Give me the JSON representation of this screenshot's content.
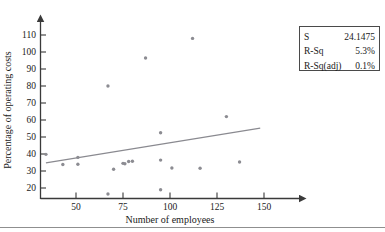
{
  "chart_data": {
    "type": "scatter",
    "title": "",
    "xlabel": "Number of employees",
    "ylabel": "Percentage of operating costs",
    "xlim": [
      30,
      160
    ],
    "ylim": [
      14,
      116
    ],
    "xticks": [
      50,
      75,
      100,
      125,
      150
    ],
    "yticks": [
      20,
      30,
      40,
      50,
      60,
      70,
      80,
      90,
      100,
      110
    ],
    "xtick_labels": [
      "50",
      "75",
      "100",
      "125",
      "150"
    ],
    "ytick_labels": [
      "20",
      "30",
      "40",
      "50",
      "60",
      "70",
      "80",
      "90",
      "100",
      "110"
    ],
    "grid": false,
    "legend": "none",
    "marker_color": "#8c8c92",
    "line_color": "#8a8a90",
    "axis_color": "#3a3a3a",
    "points": [
      {
        "x": 34,
        "y": 39.8
      },
      {
        "x": 43,
        "y": 33.8
      },
      {
        "x": 51,
        "y": 38.0
      },
      {
        "x": 51,
        "y": 34.0
      },
      {
        "x": 67,
        "y": 80.0
      },
      {
        "x": 67,
        "y": 16.5
      },
      {
        "x": 70,
        "y": 31.0
      },
      {
        "x": 75,
        "y": 34.5
      },
      {
        "x": 76,
        "y": 34.3
      },
      {
        "x": 78,
        "y": 35.6
      },
      {
        "x": 80,
        "y": 35.7
      },
      {
        "x": 87,
        "y": 96.5
      },
      {
        "x": 95,
        "y": 52.5
      },
      {
        "x": 95,
        "y": 36.4
      },
      {
        "x": 95,
        "y": 19.0
      },
      {
        "x": 101,
        "y": 31.8
      },
      {
        "x": 112,
        "y": 108.0
      },
      {
        "x": 116,
        "y": 31.6
      },
      {
        "x": 130,
        "y": 62.0
      },
      {
        "x": 137,
        "y": 35.3
      }
    ],
    "fit_line": {
      "x1": 34,
      "y1": 34.8,
      "x2": 148,
      "y2": 55.2
    },
    "annotations": {
      "stats": [
        {
          "label": "S",
          "value": "24.1475"
        },
        {
          "label": "R-Sq",
          "value": "5.3%"
        },
        {
          "label": "R-Sq(adj)",
          "value": "0.1%"
        }
      ]
    }
  }
}
